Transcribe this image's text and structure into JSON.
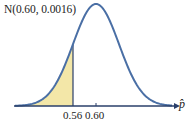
{
  "chart_data": {
    "type": "area",
    "title": "N(0.60, 0.0016)",
    "distribution": "normal",
    "mean": 0.6,
    "variance": 0.0016,
    "std_dev": 0.04,
    "xlabel": "p̂",
    "ylabel": "",
    "x_ticks": [
      0.56,
      0.6
    ],
    "tick_label_text": "0.56 0.60",
    "shaded_region": {
      "from": "-inf",
      "to": 0.56,
      "color": "#f3e7a8"
    },
    "vertical_line_at": 0.56,
    "curve_color": "#4a6fa5",
    "axis_color": "#2a3f6a",
    "grid": false,
    "legend": null,
    "x": [
      0.48,
      0.5,
      0.52,
      0.54,
      0.56,
      0.58,
      0.6,
      0.62,
      0.64,
      0.66,
      0.68,
      0.7
    ],
    "density": [
      1.35,
      4.38,
      13.5,
      32.38,
      60.5,
      88.01,
      99.73,
      88.01,
      60.5,
      32.38,
      13.5,
      4.38
    ]
  }
}
